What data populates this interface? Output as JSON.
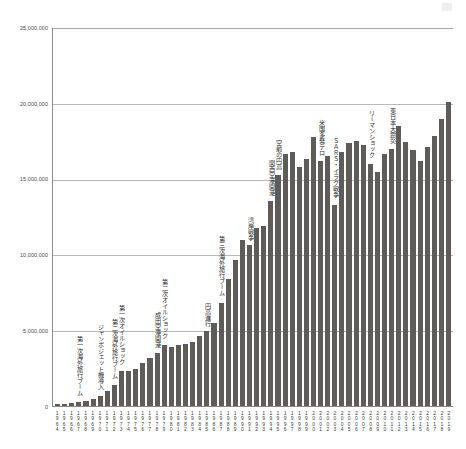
{
  "chart_data": {
    "type": "bar",
    "title": "",
    "xlabel": "",
    "ylabel": "",
    "ylim": [
      0,
      25000000
    ],
    "ytick_labels": [
      "25,000,000",
      "20,000,000",
      "15,000,000",
      "10,000,000",
      "5,000,000",
      "0"
    ],
    "ytick_values": [
      25000000,
      20000000,
      15000000,
      10000000,
      5000000,
      0
    ],
    "grid": true,
    "legend": "none",
    "bar_color": "#5f5b58",
    "categories": [
      "1964",
      "1965",
      "1966",
      "1967",
      "1968",
      "1969",
      "1970",
      "1971",
      "1972",
      "1973",
      "1974",
      "1975",
      "1976",
      "1977",
      "1978",
      "1979",
      "1980",
      "1981",
      "1982",
      "1983",
      "1984",
      "1985",
      "1986",
      "1987",
      "1988",
      "1989",
      "1990",
      "1991",
      "1992",
      "1993",
      "1994",
      "1995",
      "1996",
      "1997",
      "1998",
      "1999",
      "2000",
      "2001",
      "2002",
      "2003",
      "2004",
      "2005",
      "2006",
      "2007",
      "2008",
      "2009",
      "2010",
      "2011",
      "2012",
      "2013",
      "2014",
      "2015",
      "2016",
      "2017",
      "2018",
      "2019"
    ],
    "values": [
      128000,
      159000,
      212000,
      268000,
      344000,
      493000,
      663000,
      961000,
      1392000,
      2289000,
      2336000,
      2466000,
      2853000,
      3151000,
      3525000,
      4038000,
      3909000,
      4006000,
      4086000,
      4232000,
      4659000,
      4948000,
      5516000,
      6829000,
      8427000,
      9663000,
      10997000,
      10634000,
      11791000,
      11934000,
      13579000,
      15298000,
      16695000,
      16803000,
      15806000,
      16358000,
      17819000,
      16216000,
      16523000,
      13296000,
      16831000,
      17404000,
      17535000,
      17295000,
      15987000,
      15446000,
      16637000,
      16994000,
      18491000,
      17473000,
      16903000,
      16214000,
      17116000,
      17889000,
      18954000,
      20081000
    ],
    "annotations": [
      {
        "text": "第一次海外旅行ブーム",
        "year": "1967"
      },
      {
        "text": "ジャンボジェット機導入",
        "year": "1970"
      },
      {
        "text": "第二次海外旅行ブーム",
        "year": "1972"
      },
      {
        "text": "第一次オイルショック",
        "year": "1973"
      },
      {
        "text": "第二次オイルショック",
        "year": "1979"
      },
      {
        "text": "成田空港開港",
        "year": "1978"
      },
      {
        "text": "円高進行",
        "year": "1985"
      },
      {
        "text": "第三次海外旅行ブーム",
        "year": "1987"
      },
      {
        "text": "湾岸戦争",
        "year": "1991"
      },
      {
        "text": "空前の円高",
        "year": "1995"
      },
      {
        "text": "関西空港開港",
        "year": "1994"
      },
      {
        "text": "米国多発テロ",
        "year": "2001"
      },
      {
        "text": "ＳＡＲＳ・イラク戦争",
        "year": "2003"
      },
      {
        "text": "リーマンショック",
        "year": "2008"
      },
      {
        "text": "東日本大震災",
        "year": "2011"
      }
    ]
  }
}
